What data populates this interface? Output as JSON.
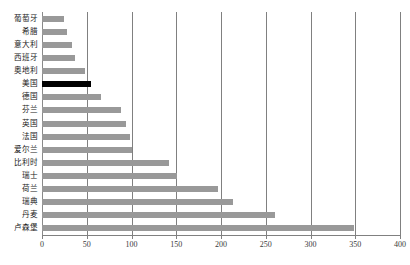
{
  "chart_data": {
    "type": "bar",
    "orientation": "horizontal",
    "title": "",
    "xlabel": "",
    "ylabel": "",
    "xlim": [
      0,
      400
    ],
    "ylim": null,
    "grid": true,
    "legend": null,
    "xticks": [
      "0",
      "50",
      "100",
      "150",
      "200",
      "250",
      "300",
      "350",
      "400"
    ],
    "xtick_values": [
      0,
      50,
      100,
      150,
      200,
      250,
      300,
      350,
      400
    ],
    "categories": [
      "葡萄牙",
      "希腊",
      "意大利",
      "西班牙",
      "奥地利",
      "美国",
      "德国",
      "芬兰",
      "英国",
      "法国",
      "爱尔兰",
      "比利时",
      "瑞士",
      "荷兰",
      "瑞典",
      "丹麦",
      "卢森堡"
    ],
    "values": [
      25,
      28,
      33,
      37,
      48,
      55,
      66,
      88,
      94,
      98,
      101,
      142,
      151,
      197,
      213,
      260,
      349
    ],
    "highlight_index": 5,
    "highlight_category": "美国",
    "colors": {
      "bar": "#999999",
      "bar_highlight": "#000000",
      "gridline": "#808080",
      "axis": "#808080",
      "text": "#222222",
      "background": "#ffffff"
    }
  }
}
